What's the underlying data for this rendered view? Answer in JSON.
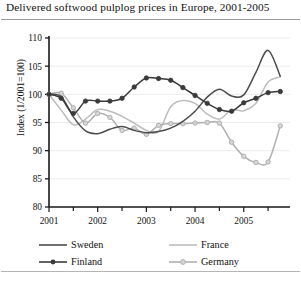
{
  "figure": {
    "title": "Delivered softwood pulplog prices in Europe, 2001-2005"
  },
  "chart_data": {
    "type": "line",
    "title": "Delivered softwood pulplog prices in Europe, 2001-2005",
    "xlabel": "",
    "ylabel": "Index (1/2001=100)",
    "ylim": [
      80,
      110
    ],
    "ytick_values": [
      80,
      85,
      90,
      95,
      100,
      105,
      110
    ],
    "ytick_labels": [
      "80",
      "85",
      "90",
      "95",
      "100",
      "105",
      "110"
    ],
    "xlim": [
      2001.0,
      2005.95
    ],
    "xtick_labels": [
      "2001",
      "2002",
      "2003",
      "2004",
      "2005"
    ],
    "xtick_values": [
      2001,
      2002,
      2003,
      2004,
      2005
    ],
    "minor_xticks_per_year": 2,
    "grid": "horizontal",
    "legend_position": "below",
    "x": [
      2001.0,
      2001.25,
      2001.5,
      2001.75,
      2002.0,
      2002.25,
      2002.5,
      2002.75,
      2003.0,
      2003.25,
      2003.5,
      2003.75,
      2004.0,
      2004.25,
      2004.5,
      2004.75,
      2005.0,
      2005.25,
      2005.5,
      2005.75
    ],
    "series": [
      {
        "name": "Sweden",
        "color": "#4d4d4d",
        "marker": "none",
        "values": [
          100.0,
          99.6,
          96.0,
          93.5,
          93.0,
          93.8,
          94.3,
          93.6,
          93.2,
          93.4,
          94.0,
          95.2,
          97.0,
          99.5,
          100.9,
          99.7,
          99.9,
          103.9,
          107.8,
          103.2
        ]
      },
      {
        "name": "Finland",
        "color": "#3a3a3a",
        "marker": "filled-circle",
        "values": [
          100.0,
          99.3,
          96.6,
          98.8,
          98.8,
          98.8,
          99.3,
          101.3,
          102.9,
          102.8,
          102.5,
          101.2,
          99.8,
          98.4,
          97.3,
          97.0,
          98.5,
          99.3,
          100.3,
          100.5
        ]
      },
      {
        "name": "France",
        "color": "#bdbdbd",
        "marker": "none",
        "values": [
          100.0,
          97.2,
          94.6,
          95.6,
          97.3,
          97.0,
          96.1,
          94.9,
          93.6,
          93.4,
          97.8,
          98.9,
          98.4,
          96.5,
          95.6,
          97.2,
          97.1,
          98.4,
          102.2,
          103.1
        ]
      },
      {
        "name": "Germany",
        "color": "#b0b0b0",
        "marker": "open-circle",
        "values": [
          100.0,
          100.2,
          97.6,
          94.9,
          96.6,
          95.9,
          93.6,
          94.0,
          92.9,
          94.5,
          94.8,
          94.8,
          94.9,
          95.0,
          94.9,
          91.5,
          89.0,
          87.9,
          88.0,
          94.4
        ]
      }
    ]
  },
  "legend": {
    "entries": [
      {
        "label": "Sweden",
        "color": "#4d4d4d",
        "marker": "none"
      },
      {
        "label": "Finland",
        "color": "#3a3a3a",
        "marker": "filled-circle"
      },
      {
        "label": "France",
        "color": "#bdbdbd",
        "marker": "none"
      },
      {
        "label": "Germany",
        "color": "#b0b0b0",
        "marker": "open-circle"
      }
    ]
  }
}
